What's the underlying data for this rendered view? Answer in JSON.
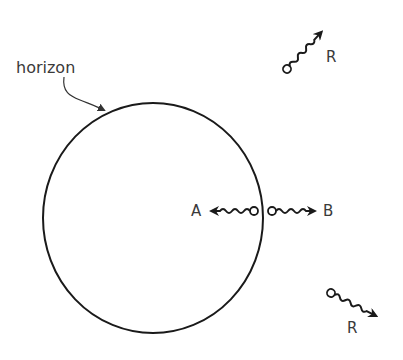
{
  "diagram": {
    "type": "black-hole-hawking-radiation",
    "labels": {
      "horizon": "horizon",
      "particle_a": "A",
      "particle_b": "B",
      "radiation_1": "R",
      "radiation_2": "R"
    },
    "colors": {
      "stroke": "#1a1a1a",
      "text": "#3a3a3a",
      "background": "#ffffff"
    },
    "elements": [
      {
        "id": "horizon-circle",
        "kind": "circle",
        "cx": 153,
        "cy": 218,
        "rx": 110,
        "ry": 115
      },
      {
        "id": "horizon-pointer",
        "kind": "curved-arrow",
        "from": "horizon label",
        "to": "horizon circle top-left"
      },
      {
        "id": "particle-a",
        "kind": "wavy-arrow",
        "direction": "left",
        "origin": "inside horizon"
      },
      {
        "id": "particle-b",
        "kind": "wavy-arrow",
        "direction": "right",
        "origin": "outside horizon"
      },
      {
        "id": "radiation-1",
        "kind": "wavy-arrow",
        "direction": "up-right"
      },
      {
        "id": "radiation-2",
        "kind": "wavy-arrow",
        "direction": "down-right"
      }
    ]
  }
}
